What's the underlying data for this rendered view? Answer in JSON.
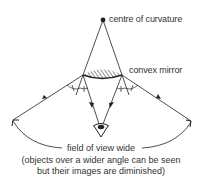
{
  "diagram": {
    "type": "optics-ray-diagram",
    "labels": {
      "centre": "centre of curvature",
      "mirror": "convex mirror",
      "field": "field of view wide"
    },
    "caption": {
      "line1": "(objects over a wider angle can be seen",
      "line2": "but their images are diminished)"
    },
    "colors": {
      "ink": "#222222",
      "text": "#333333",
      "background": "#ffffff"
    },
    "points": {
      "centre_of_curvature": [
        103,
        20
      ],
      "mirror_left": [
        83,
        75
      ],
      "mirror_right": [
        122,
        75
      ],
      "eye": [
        101,
        128
      ],
      "ray_left_outer": [
        13,
        120
      ],
      "ray_right_outer": [
        191,
        121
      ]
    }
  }
}
